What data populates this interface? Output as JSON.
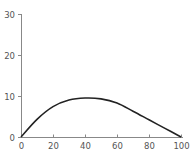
{
  "chart_data": {
    "type": "line",
    "title": "",
    "xlabel": "",
    "ylabel": "",
    "xlim": [
      0,
      100
    ],
    "ylim": [
      0,
      30
    ],
    "x_ticks": [
      0,
      20,
      40,
      60,
      80,
      100
    ],
    "y_ticks": [
      0,
      10,
      20,
      30
    ],
    "grid": false,
    "legend": null,
    "series": [
      {
        "name": "series-1",
        "color": "#222222",
        "x": [
          0,
          10,
          20,
          30,
          40,
          50,
          60,
          70,
          80,
          90,
          100
        ],
        "y": [
          0,
          4.3,
          7.4,
          9.0,
          9.5,
          9.3,
          8.3,
          6.3,
          4.2,
          2.1,
          0
        ]
      }
    ]
  },
  "colors": {
    "axis": "#888888",
    "line": "#222222",
    "text": "#555555"
  }
}
